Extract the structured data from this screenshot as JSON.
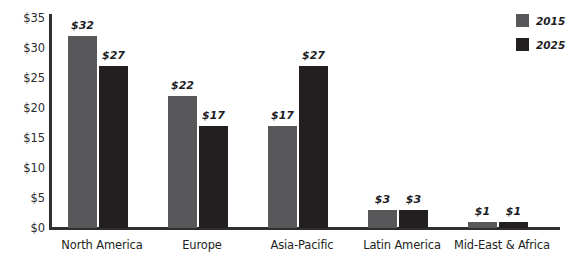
{
  "chart_data": {
    "type": "bar",
    "title": "",
    "xlabel": "",
    "ylabel": "",
    "categories": [
      "North America",
      "Europe",
      "Asia-Pacific",
      "Latin America",
      "Mid-East & Africa"
    ],
    "series": [
      {
        "name": "2015",
        "color": "#58585a",
        "values": [
          32,
          22,
          17,
          3,
          1
        ],
        "labels": [
          "$32",
          "$22",
          "$17",
          "$3",
          "$1"
        ]
      },
      {
        "name": "2025",
        "color": "#231f20",
        "values": [
          27,
          17,
          27,
          3,
          1
        ],
        "labels": [
          "$27",
          "$17",
          "$27",
          "$3",
          "$1"
        ]
      }
    ],
    "ylim": [
      0,
      35
    ],
    "ytick_values": [
      0,
      5,
      10,
      15,
      20,
      25,
      30,
      35
    ],
    "ytick_labels": [
      "$0",
      "$5",
      "$10",
      "$15",
      "$20",
      "$25",
      "$30",
      "$35"
    ],
    "grid": false,
    "legend_position": "top-right",
    "legend_entries": [
      "2015",
      "2025"
    ]
  },
  "axis_color": "#2f2f31",
  "background": "#ffffff"
}
